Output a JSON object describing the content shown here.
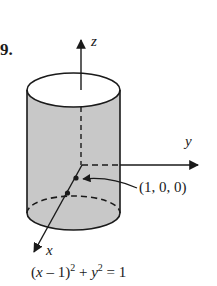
{
  "problem_number": "9.",
  "axes": {
    "z": "z",
    "y": "y",
    "x": "x"
  },
  "point_label": "(1, 0, 0)",
  "equation": {
    "var_x": "x",
    "minus_one": " – 1)",
    "exp1": "2",
    "plus": " + ",
    "var_y": "y",
    "exp2": "2",
    "rhs": " = 1"
  },
  "colors": {
    "cylinder_fill": "#c8c8c8",
    "stroke": "#1a1a1a"
  }
}
